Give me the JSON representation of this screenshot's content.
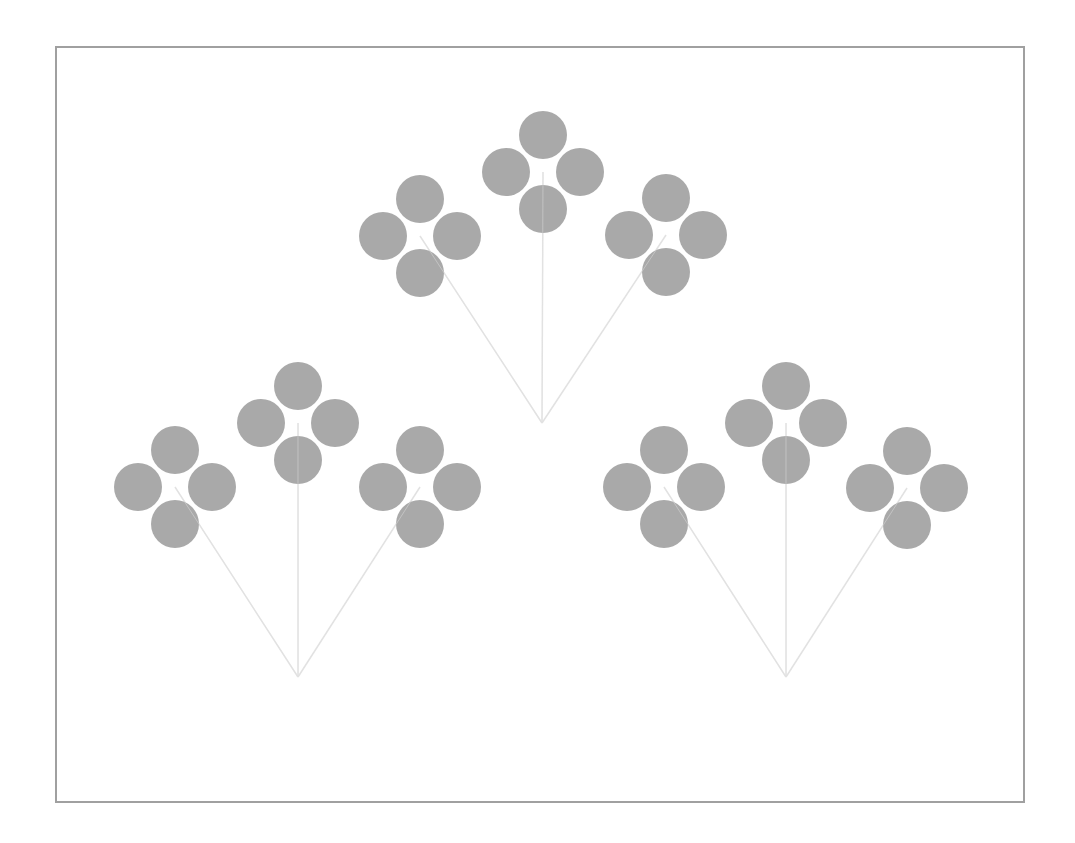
{
  "diagram": {
    "type": "fractal-flower-tree",
    "frame": {
      "x": 56,
      "y": 47,
      "width": 968,
      "height": 755,
      "stroke": "#a0a0a0",
      "stroke_width": 2
    },
    "colors": {
      "petal": "#a9a9a9",
      "stem": "#e2e2e2",
      "background": "#ffffff"
    },
    "petal_radius": 24,
    "petal_offset": 37,
    "groups": [
      {
        "name": "top-group",
        "apex": [
          542,
          423
        ],
        "flowers": [
          [
            420,
            236
          ],
          [
            543,
            172
          ],
          [
            666,
            235
          ]
        ]
      },
      {
        "name": "left-group",
        "apex": [
          298,
          677
        ],
        "flowers": [
          [
            175,
            487
          ],
          [
            298,
            423
          ],
          [
            420,
            487
          ]
        ]
      },
      {
        "name": "right-group",
        "apex": [
          786,
          677
        ],
        "flowers": [
          [
            664,
            487
          ],
          [
            786,
            423
          ],
          [
            907,
            488
          ]
        ]
      }
    ]
  }
}
